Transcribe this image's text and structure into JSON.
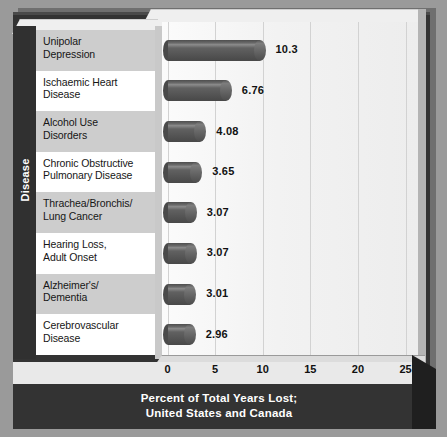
{
  "chart_data": {
    "type": "bar",
    "orientation": "horizontal",
    "title": "Percent of Total Years Lost; United States and Canada",
    "title_line1": "Percent of Total Years Lost;",
    "title_line2": "United States and Canada",
    "xlabel": "Percent of Total Years Lost; United States and Canada",
    "ylabel": "Disease",
    "xlim": [
      0,
      25
    ],
    "xticks": [
      "0",
      "5",
      "10",
      "15",
      "20",
      "25"
    ],
    "grid": true,
    "legend": "none",
    "categories": [
      "Unipolar Depression",
      "Ischaemic Heart Disease",
      "Alcohol Use Disorders",
      "Chronic Obstructive Pulmonary Disease",
      "Thrachea/Bronchis/ Lung Cancer",
      "Hearing Loss, Adult Onset",
      "Alzheimer's/ Dementia",
      "Cerebrovascular Disease"
    ],
    "values": [
      10.3,
      6.76,
      4.08,
      3.65,
      3.07,
      3.07,
      3.01,
      2.96
    ],
    "value_labels": [
      "10.3",
      "6.76",
      "4.08",
      "3.65",
      "3.07",
      "3.07",
      "3.01",
      "2.96"
    ]
  },
  "rows": [
    {
      "line1": "Unipolar",
      "line2": "Depression",
      "value": 10.3,
      "label": "10.3"
    },
    {
      "line1": "Ischaemic Heart",
      "line2": "Disease",
      "value": 6.76,
      "label": "6.76"
    },
    {
      "line1": "Alcohol Use",
      "line2": "Disorders",
      "value": 4.08,
      "label": "4.08"
    },
    {
      "line1": "Chronic Obstructive",
      "line2": "Pulmonary Disease",
      "value": 3.65,
      "label": "3.65"
    },
    {
      "line1": "Thrachea/Bronchis/",
      "line2": "Lung Cancer",
      "value": 3.07,
      "label": "3.07"
    },
    {
      "line1": "Hearing Loss,",
      "line2": "Adult Onset",
      "value": 3.07,
      "label": "3.07"
    },
    {
      "line1": "Alzheimer's/",
      "line2": "Dementia",
      "value": 3.01,
      "label": "3.01"
    },
    {
      "line1": "Cerebrovascular",
      "line2": "Disease",
      "value": 2.96,
      "label": "2.96"
    }
  ],
  "axis": {
    "y_title": "Disease",
    "x_ticks": [
      "0",
      "5",
      "10",
      "15",
      "20",
      "25"
    ]
  },
  "title": {
    "line1": "Percent of Total Years Lost;",
    "line2": "United States and Canada"
  },
  "colors": {
    "background": "#9a9a9a",
    "frame_dark": "#333333",
    "plot_background": "#f4f4f4",
    "bar": "#565656",
    "band_alt": "#cdcdcd",
    "band_plain": "#ffffff",
    "text": "#161616",
    "title_text": "#ffffff"
  }
}
